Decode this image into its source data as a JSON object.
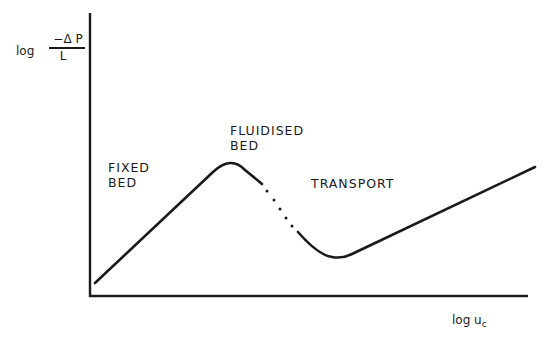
{
  "diagram": {
    "type": "line-sketch",
    "axes": {
      "y_label": {
        "prefix": "log",
        "numerator": "−Δ P",
        "denominator": "L"
      },
      "x_label": {
        "prefix": "log u",
        "subscript": "c"
      }
    },
    "regions": [
      {
        "id": "fixed-bed",
        "lines": [
          "FIXED",
          "BED"
        ]
      },
      {
        "id": "fluidised-bed",
        "lines": [
          "FLUIDISED",
          "BED"
        ]
      },
      {
        "id": "transport",
        "lines": [
          "TRANSPORT"
        ]
      }
    ],
    "curve_segments": [
      {
        "name": "fixed-bed-rise",
        "style": "solid"
      },
      {
        "name": "fluidised-dotted-transition",
        "style": "dotted"
      },
      {
        "name": "transport-rise",
        "style": "solid"
      }
    ],
    "line_color": "#1a1a1a"
  }
}
